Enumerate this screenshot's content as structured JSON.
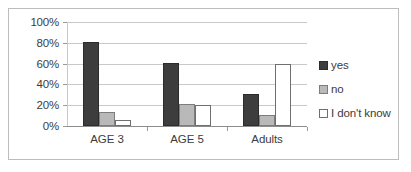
{
  "chart_data": {
    "type": "bar",
    "title": "",
    "xlabel": "",
    "ylabel": "",
    "categories": [
      "AGE 3",
      "AGE 5",
      "Adults"
    ],
    "series": [
      {
        "name": "yes",
        "color": "#3d3d3d",
        "values": [
          81,
          61,
          31
        ]
      },
      {
        "name": "no",
        "color": "#b9b9b9",
        "values": [
          13,
          21,
          11
        ]
      },
      {
        "name": "I don't know",
        "color": "#ffffff",
        "values": [
          6,
          20,
          60
        ]
      }
    ],
    "ylim": [
      0,
      100
    ],
    "ytick_labels": [
      "100%",
      "80%",
      "60%",
      "40%",
      "20%",
      "0%"
    ],
    "ytick_values": [
      100,
      80,
      60,
      40,
      20,
      0
    ],
    "grid": true,
    "legend_position": "right",
    "value_unit": "%"
  },
  "legend": {
    "entries": [
      {
        "label": "yes"
      },
      {
        "label": "no"
      },
      {
        "label": "I don't know"
      }
    ]
  }
}
